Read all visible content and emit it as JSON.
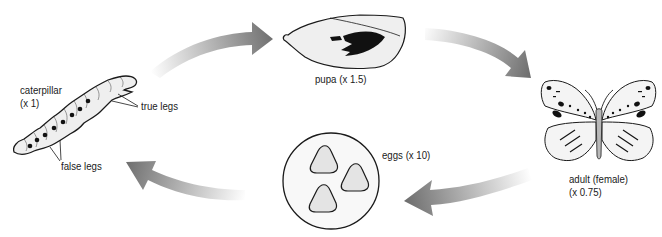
{
  "diagram": {
    "type": "life-cycle",
    "stages": [
      {
        "id": "caterpillar",
        "label_line1": "caterpillar",
        "label_line2": "(x 1)"
      },
      {
        "id": "pupa",
        "label_line1": "pupa (x 1.5)"
      },
      {
        "id": "adult",
        "label_line1": "adult (female)",
        "label_line2": "(x 0.75)"
      },
      {
        "id": "eggs",
        "label_line1": "eggs (x 10)"
      }
    ],
    "annotations": {
      "true_legs": "true legs",
      "false_legs": "false legs"
    },
    "arrows": [
      {
        "from": "caterpillar",
        "to": "pupa"
      },
      {
        "from": "pupa",
        "to": "adult"
      },
      {
        "from": "adult",
        "to": "eggs"
      },
      {
        "from": "eggs",
        "to": "caterpillar"
      }
    ],
    "colors": {
      "arrow_dark": "#6e6e6e",
      "arrow_light": "#ffffff",
      "fill_light": "#efefef",
      "outline": "#1a1a1a",
      "body_gray": "#b8b8b8"
    }
  }
}
